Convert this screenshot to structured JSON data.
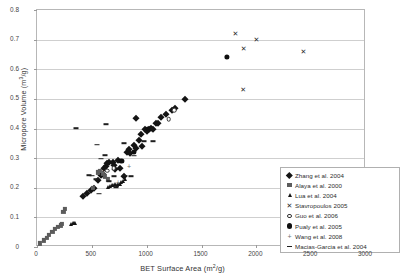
{
  "chart_data": {
    "type": "scatter",
    "title": "",
    "xlabel": "BET Surface Area (m2/g)",
    "xlabel_main": "BET Surface Area (m",
    "xlabel_sup": "2",
    "xlabel_tail": "/g)",
    "ylabel": "Micropore Volume (m3/g)",
    "ylabel_main": "Micropore Volume (m",
    "ylabel_sup": "3",
    "ylabel_tail": "/g)",
    "xlim": [
      0,
      3000
    ],
    "ylim": [
      0,
      0.8
    ],
    "xticks": [
      0,
      500,
      1000,
      1500,
      2000,
      2500,
      3000
    ],
    "xtick_labels": [
      "0",
      "500",
      "1000",
      "1500",
      "2000",
      "2500",
      "3000"
    ],
    "yticks": [
      0,
      0.1,
      0.2,
      0.3,
      0.4,
      0.5,
      0.6,
      0.7,
      0.8
    ],
    "ytick_labels": [
      "0",
      "0.1",
      "0.2",
      "0.3",
      "0.4",
      "0.5",
      "0.6",
      "0.7",
      "0.8"
    ],
    "grid": "horizontal",
    "legend_position": "inside-bottom-right",
    "series": [
      {
        "name": "Zhang et al. 2004",
        "marker": "diamond",
        "color": "#141414",
        "points": [
          [
            610,
            0.265
          ],
          [
            625,
            0.272
          ],
          [
            640,
            0.285
          ],
          [
            660,
            0.288
          ],
          [
            690,
            0.287
          ],
          [
            700,
            0.278
          ],
          [
            715,
            0.262
          ],
          [
            735,
            0.292
          ],
          [
            760,
            0.268
          ],
          [
            790,
            0.238
          ],
          [
            820,
            0.322
          ],
          [
            835,
            0.33
          ],
          [
            850,
            0.318
          ],
          [
            880,
            0.345
          ],
          [
            905,
            0.334
          ],
          [
            930,
            0.362
          ],
          [
            950,
            0.383
          ],
          [
            960,
            0.34
          ],
          [
            905,
            0.436
          ],
          [
            985,
            0.398
          ],
          [
            1000,
            0.392
          ],
          [
            1020,
            0.4
          ],
          [
            1040,
            0.402
          ],
          [
            1060,
            0.4
          ],
          [
            1085,
            0.42
          ],
          [
            1105,
            0.418
          ],
          [
            1130,
            0.44
          ],
          [
            1180,
            0.448
          ],
          [
            1230,
            0.462
          ],
          [
            1260,
            0.468
          ],
          [
            1350,
            0.5
          ],
          [
            490,
            0.193
          ],
          [
            520,
            0.2
          ],
          [
            560,
            0.225
          ],
          [
            585,
            0.242
          ],
          [
            600,
            0.248
          ],
          [
            420,
            0.172
          ],
          [
            455,
            0.182
          ]
        ]
      },
      {
        "name": "Alaya et al. 2000",
        "marker": "square",
        "color": "#5c5c5c",
        "points": [
          [
            30,
            0.012
          ],
          [
            60,
            0.022
          ],
          [
            90,
            0.032
          ],
          [
            110,
            0.04
          ],
          [
            140,
            0.05
          ],
          [
            165,
            0.06
          ],
          [
            190,
            0.068
          ],
          [
            215,
            0.073
          ],
          [
            230,
            0.078
          ],
          [
            240,
            0.118
          ],
          [
            255,
            0.128
          ],
          [
            510,
            0.2
          ],
          [
            555,
            0.252
          ],
          [
            575,
            0.258
          ],
          [
            600,
            0.248
          ],
          [
            620,
            0.238
          ],
          [
            650,
            0.228
          ]
        ]
      },
      {
        "name": "Lua et al. 2004",
        "marker": "triangle",
        "color": "#141414",
        "points": [
          [
            310,
            0.078
          ],
          [
            325,
            0.082
          ],
          [
            335,
            0.08
          ],
          [
            350,
            0.082
          ],
          [
            650,
            0.204
          ],
          [
            665,
            0.205
          ],
          [
            680,
            0.208
          ],
          [
            695,
            0.21
          ],
          [
            710,
            0.212
          ],
          [
            725,
            0.21
          ],
          [
            740,
            0.214
          ],
          [
            755,
            0.213
          ],
          [
            770,
            0.218
          ],
          [
            785,
            0.222
          ],
          [
            800,
            0.228
          ]
        ]
      },
      {
        "name": "Stavropoulos 2005",
        "marker": "cross",
        "color": "#2b2b2b",
        "points": [
          [
            1810,
            0.722
          ],
          [
            1885,
            0.672
          ],
          [
            2000,
            0.702
          ],
          [
            2430,
            0.662
          ],
          [
            1880,
            0.535
          ]
        ]
      },
      {
        "name": "Guo et al. 2006",
        "marker": "circle-open",
        "color": "#333333",
        "points": [
          [
            1200,
            0.432
          ],
          [
            1250,
            0.462
          ],
          [
            700,
            0.265
          ],
          [
            640,
            0.258
          ]
        ]
      },
      {
        "name": "Pualy et al. 2005",
        "marker": "circle-filled",
        "color": "#0f0f0f",
        "points": [
          [
            1730,
            0.642
          ],
          [
            770,
            0.29
          ],
          [
            880,
            0.322
          ],
          [
            1010,
            0.4
          ]
        ]
      },
      {
        "name": "Wang et al. 2008",
        "marker": "plus",
        "color": "#6e6e6e",
        "points": [
          [
            600,
            0.252
          ],
          [
            740,
            0.218
          ],
          [
            840,
            0.272
          ]
        ]
      },
      {
        "name": "Macias-Garcia et al. 2004",
        "marker": "dash",
        "color": "#1e1e1e",
        "points": [
          [
            360,
            0.402
          ],
          [
            545,
            0.345
          ],
          [
            625,
            0.415
          ],
          [
            620,
            0.31
          ],
          [
            585,
            0.298
          ],
          [
            505,
            0.24
          ],
          [
            470,
            0.242
          ],
          [
            565,
            0.18
          ],
          [
            790,
            0.35
          ],
          [
            800,
            0.24
          ],
          [
            860,
            0.238
          ],
          [
            880,
            0.308
          ],
          [
            980,
            0.358
          ],
          [
            1060,
            0.358
          ],
          [
            700,
            0.238
          ],
          [
            660,
            0.222
          ],
          [
            720,
            0.202
          ],
          [
            540,
            0.228
          ]
        ]
      }
    ]
  },
  "legend": {
    "items": [
      {
        "label": "Zhang et al. 2004",
        "marker": "diamond"
      },
      {
        "label": "Alaya et al. 2000",
        "marker": "square"
      },
      {
        "label": "Lua et al. 2004",
        "marker": "triangle"
      },
      {
        "label": "Stavropoulos 2005",
        "marker": "cross"
      },
      {
        "label": "Guo et al. 2006",
        "marker": "circle-open"
      },
      {
        "label": "Pualy et al. 2005",
        "marker": "circle-filled"
      },
      {
        "label": "Wang et al. 2008",
        "marker": "plus"
      },
      {
        "label": "Macias-Garcia et al. 2004",
        "marker": "dash"
      }
    ]
  }
}
